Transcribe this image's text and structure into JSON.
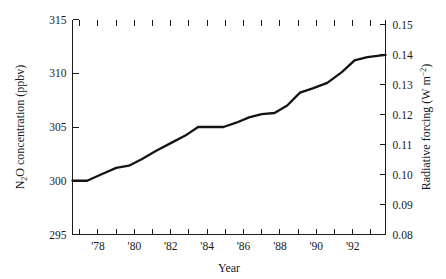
{
  "chart_data": {
    "type": "line",
    "title": "",
    "xlabel": "Year",
    "ylabel": "N2O concentration (ppbv)",
    "ylabel_right": "Radiative forcing (W m-2)",
    "xlim": [
      1976.6,
      1993.8
    ],
    "ylim": [
      295,
      315
    ],
    "ylim_right": [
      0.08,
      0.1517
    ],
    "grid": false,
    "legend": null,
    "x_tick_values": [
      1977,
      1978,
      1979,
      1980,
      1981,
      1982,
      1983,
      1984,
      1985,
      1986,
      1987,
      1988,
      1989,
      1990,
      1991,
      1992,
      1993
    ],
    "x_tick_labels": [
      "",
      "'78",
      "",
      "'80",
      "",
      "'82",
      "",
      "'84",
      "",
      "'86",
      "",
      "'88",
      "",
      "'90",
      "",
      "'92",
      ""
    ],
    "y_tick_values": [
      295,
      300,
      305,
      310,
      315
    ],
    "y_tick_labels": [
      "295",
      "300",
      "305",
      "310",
      "315"
    ],
    "y_right_tick_values": [
      0.08,
      0.09,
      0.1,
      0.11,
      0.12,
      0.13,
      0.14,
      0.15
    ],
    "y_right_tick_labels": [
      "0.08",
      "0.09",
      "0.10",
      "0.11",
      "0.12",
      "0.13",
      "0.14",
      "0.15"
    ],
    "series": [
      {
        "name": "N2O concentration",
        "x": [
          1976.6,
          1977.4,
          1978.2,
          1979.0,
          1979.7,
          1980.4,
          1981.2,
          1982.0,
          1982.8,
          1983.5,
          1984.2,
          1984.9,
          1985.6,
          1986.3,
          1987.0,
          1987.7,
          1988.4,
          1989.1,
          1989.8,
          1990.6,
          1991.4,
          1992.1,
          1992.8,
          1993.8
        ],
        "y": [
          300.0,
          300.0,
          300.6,
          301.2,
          301.4,
          302.0,
          302.8,
          303.5,
          304.2,
          305.0,
          305.0,
          305.0,
          305.4,
          305.9,
          306.2,
          306.3,
          307.0,
          308.2,
          308.6,
          309.1,
          310.1,
          311.2,
          311.5,
          311.7
        ]
      }
    ]
  },
  "axes": {
    "x_title": "Year",
    "y_left_title_main": "O concentration (ppbv)",
    "y_left_title_lead": "N",
    "y_left_title_sub": "2",
    "y_right_title_lead": "Radiative forcing (W m",
    "y_right_title_sup": "−2",
    "y_right_title_tail": ")"
  }
}
